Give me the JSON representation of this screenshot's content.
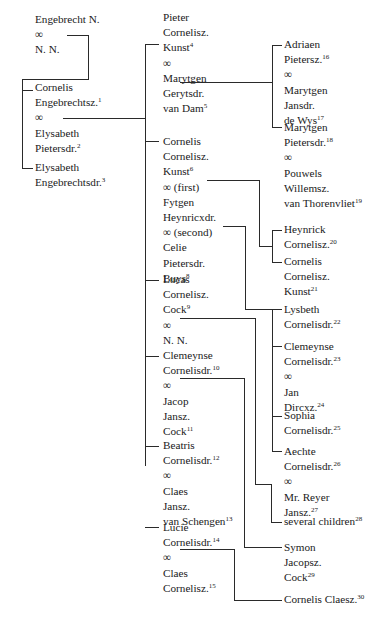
{
  "people": {
    "engebrecht": {
      "lines": [
        "Engebrecht N.",
        "∞",
        "N. N."
      ],
      "notes": [
        "",
        "",
        ""
      ]
    },
    "cornelis_e": {
      "lines": [
        "Cornelis",
        "Engebrechtsz.",
        "∞",
        "Elysabeth",
        "Pietersdr."
      ],
      "notes": [
        "",
        "1",
        "",
        "",
        "2"
      ]
    },
    "elysabeth_e": {
      "lines": [
        "Elysabeth",
        "Engebrechtsdr."
      ],
      "notes": [
        "",
        "3"
      ]
    },
    "pieter": {
      "lines": [
        "Pieter",
        "Cornelisz.",
        "Kunst",
        "∞",
        "Marytgen",
        "Gerytsdr.",
        "van Dam"
      ],
      "notes": [
        "",
        "",
        "4",
        "",
        "",
        "",
        "5"
      ]
    },
    "cornelis_c": {
      "lines": [
        "Cornelis",
        "Cornelisz.",
        "Kunst",
        "∞ (first)",
        "Fytgen",
        "Heynricxdr.",
        "∞ (second)",
        "Celie",
        "Pietersdr.",
        "Buys"
      ],
      "notes": [
        "",
        "",
        "6",
        "",
        "",
        "",
        "",
        "",
        "",
        "8"
      ]
    },
    "lucas": {
      "lines": [
        "Lucas",
        "Cornelisz.",
        "Cock",
        "∞",
        "N. N."
      ],
      "notes": [
        "",
        "",
        "9",
        "",
        ""
      ]
    },
    "clemeynse_c": {
      "lines": [
        "Clemeynse",
        "Cornelisdr.",
        "∞",
        "Jacop",
        "Jansz.",
        "Cock"
      ],
      "notes": [
        "",
        "10",
        "",
        "",
        "",
        "11"
      ]
    },
    "beatris": {
      "lines": [
        "Beatris",
        "Cornelisdr.",
        "∞",
        "Claes",
        "Jansz.",
        "van Schengen"
      ],
      "notes": [
        "",
        "12",
        "",
        "",
        "",
        "13"
      ]
    },
    "lucie": {
      "lines": [
        "Lucie",
        "Cornelisdr.",
        "∞",
        "Claes",
        "Cornelisz."
      ],
      "notes": [
        "",
        "14",
        "",
        "",
        "15"
      ]
    },
    "adriaen": {
      "lines": [
        "Adriaen",
        "Pietersz.",
        "∞",
        "Marytgen",
        "Jansdr.",
        "de Wys"
      ],
      "notes": [
        "",
        "16",
        "",
        "",
        "",
        "17"
      ]
    },
    "marytgen_p": {
      "lines": [
        "Marytgen",
        "Pietersdr.",
        "∞",
        "Pouwels",
        "Willemsz.",
        "van Thorenvliet"
      ],
      "notes": [
        "",
        "18",
        "",
        "",
        "",
        "19"
      ]
    },
    "heynrick": {
      "lines": [
        "Heynrick",
        "Cornelisz."
      ],
      "notes": [
        "",
        "20"
      ]
    },
    "cornelis_k": {
      "lines": [
        "Cornelis",
        "Cornelisz.",
        "Kunst"
      ],
      "notes": [
        "",
        "",
        "21"
      ]
    },
    "lysbeth": {
      "lines": [
        "Lysbeth",
        "Cornelisdr."
      ],
      "notes": [
        "",
        "22"
      ]
    },
    "clemeynse_d": {
      "lines": [
        "Clemeynse",
        "Cornelisdr.",
        "∞",
        "Jan",
        "Dircxz."
      ],
      "notes": [
        "",
        "23",
        "",
        "",
        "24"
      ]
    },
    "sophia": {
      "lines": [
        "Sophia",
        "Cornelisdr."
      ],
      "notes": [
        "",
        "25"
      ]
    },
    "aechte": {
      "lines": [
        "Aechte",
        "Cornelisdr.",
        "∞",
        "Mr. Reyer",
        "Jansz."
      ],
      "notes": [
        "",
        "26",
        "",
        "",
        "27"
      ]
    },
    "several": {
      "lines": [
        "several children"
      ],
      "notes": [
        "28"
      ]
    },
    "symon": {
      "lines": [
        "Symon",
        "Jacopsz.",
        "Cock"
      ],
      "notes": [
        "",
        "",
        "29"
      ]
    },
    "cornelis_cl": {
      "lines": [
        "Cornelis Claesz."
      ],
      "notes": [
        "30"
      ]
    }
  }
}
